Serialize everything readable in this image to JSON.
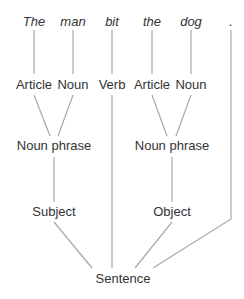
{
  "diagram": {
    "title": "",
    "line_color": "#a8a8a8",
    "text_color": "#333333",
    "words": [
      {
        "id": "w1",
        "text": "The",
        "x": 34,
        "y": 14
      },
      {
        "id": "w2",
        "text": "man",
        "x": 73,
        "y": 14
      },
      {
        "id": "w3",
        "text": "bit",
        "x": 112,
        "y": 14
      },
      {
        "id": "w4",
        "text": "the",
        "x": 152,
        "y": 14
      },
      {
        "id": "w5",
        "text": "dog",
        "x": 191,
        "y": 14
      },
      {
        "id": "w6",
        "text": ".",
        "x": 231,
        "y": 14
      }
    ],
    "pos_tags": [
      {
        "id": "p1",
        "text": "Article",
        "x": 34,
        "y": 77
      },
      {
        "id": "p2",
        "text": "Noun",
        "x": 73,
        "y": 77
      },
      {
        "id": "p3",
        "text": "Verb",
        "x": 112,
        "y": 77
      },
      {
        "id": "p4",
        "text": "Article",
        "x": 152,
        "y": 77
      },
      {
        "id": "p5",
        "text": "Noun",
        "x": 191,
        "y": 77
      }
    ],
    "phrases": [
      {
        "id": "np1",
        "text": "Noun phrase",
        "x": 54,
        "y": 138
      },
      {
        "id": "np2",
        "text": "Noun phrase",
        "x": 172,
        "y": 138
      }
    ],
    "roles": [
      {
        "id": "r1",
        "text": "Subject",
        "x": 54,
        "y": 204
      },
      {
        "id": "r2",
        "text": "Object",
        "x": 172,
        "y": 204
      }
    ],
    "root": {
      "id": "s",
      "text": "Sentence",
      "x": 123,
      "y": 271
    },
    "edges": [
      {
        "from": "w1",
        "to": "p1",
        "points": [
          [
            34,
            30
          ],
          [
            34,
            74
          ]
        ]
      },
      {
        "from": "w2",
        "to": "p2",
        "points": [
          [
            73,
            30
          ],
          [
            73,
            74
          ]
        ]
      },
      {
        "from": "w3",
        "to": "p3",
        "points": [
          [
            112,
            30
          ],
          [
            112,
            74
          ]
        ]
      },
      {
        "from": "w4",
        "to": "p4",
        "points": [
          [
            152,
            30
          ],
          [
            152,
            74
          ]
        ]
      },
      {
        "from": "w5",
        "to": "p5",
        "points": [
          [
            191,
            30
          ],
          [
            191,
            74
          ]
        ]
      },
      {
        "from": "p1",
        "to": "np1",
        "points": [
          [
            34,
            95
          ],
          [
            50,
            136
          ]
        ]
      },
      {
        "from": "p2",
        "to": "np1",
        "points": [
          [
            73,
            95
          ],
          [
            58,
            136
          ]
        ]
      },
      {
        "from": "p4",
        "to": "np2",
        "points": [
          [
            152,
            95
          ],
          [
            167,
            136
          ]
        ]
      },
      {
        "from": "p5",
        "to": "np2",
        "points": [
          [
            191,
            95
          ],
          [
            176,
            136
          ]
        ]
      },
      {
        "from": "np1",
        "to": "r1",
        "points": [
          [
            54,
            157
          ],
          [
            54,
            202
          ]
        ]
      },
      {
        "from": "np2",
        "to": "r2",
        "points": [
          [
            172,
            157
          ],
          [
            172,
            202
          ]
        ]
      },
      {
        "from": "p3",
        "to": "s",
        "points": [
          [
            112,
            95
          ],
          [
            112,
            268
          ]
        ]
      },
      {
        "from": "r1",
        "to": "s",
        "points": [
          [
            54,
            222
          ],
          [
            92,
            268
          ]
        ]
      },
      {
        "from": "r2",
        "to": "s",
        "points": [
          [
            172,
            222
          ],
          [
            135,
            268
          ]
        ]
      },
      {
        "from": "w6",
        "to": "s",
        "points": [
          [
            231,
            30
          ],
          [
            231,
            219
          ],
          [
            153,
            268
          ]
        ]
      }
    ]
  }
}
